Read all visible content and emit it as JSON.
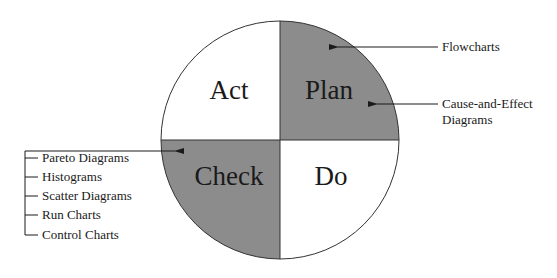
{
  "diagram": {
    "type": "PDCA cycle",
    "colors": {
      "shaded": "#8c8c8c",
      "unshaded": "#ffffff",
      "stroke": "#333333",
      "text": "#1a1a1a"
    },
    "quadrants": [
      {
        "id": "act",
        "label": "Act",
        "position": "top-left",
        "shaded": false
      },
      {
        "id": "plan",
        "label": "Plan",
        "position": "top-right",
        "shaded": true
      },
      {
        "id": "do",
        "label": "Do",
        "position": "bottom-right",
        "shaded": false
      },
      {
        "id": "check",
        "label": "Check",
        "position": "bottom-left",
        "shaded": true
      }
    ],
    "plan_tools": [
      {
        "label": "Flowcharts"
      },
      {
        "label_line1": "Cause-and-Effect",
        "label_line2": "Diagrams"
      }
    ],
    "check_tools": [
      "Pareto Diagrams",
      "Histograms",
      "Scatter Diagrams",
      "Run Charts",
      "Control Charts"
    ]
  }
}
